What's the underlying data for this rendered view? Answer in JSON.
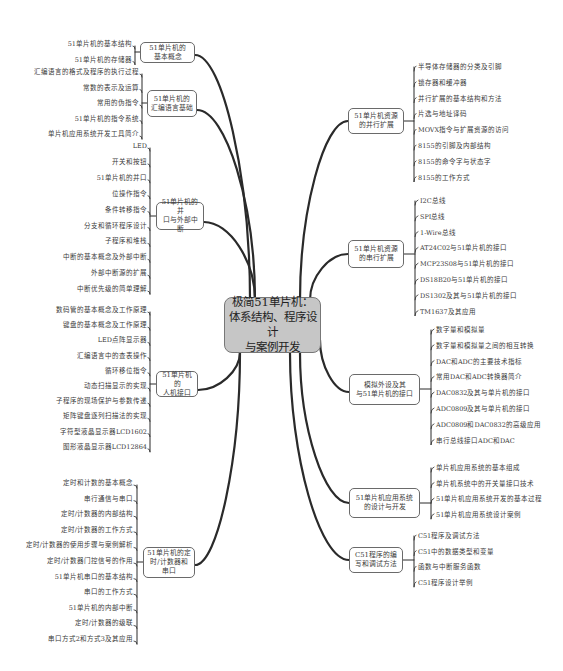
{
  "center": {
    "label": "极简51单片机：\n体系结构、程序设计\n与案例开发"
  },
  "left_branches": [
    {
      "label": "51单片机的\n基本概念",
      "children": [
        "51单片机的基本结构",
        "51单片机的存储器"
      ]
    },
    {
      "label": "51单片机的\n汇编语言基础",
      "children": [
        "汇编语言的格式及程序的执行过程",
        "常数的表示及运算",
        "常用的伪指令",
        "51单片机的指令系统",
        "单片机应用系统开发工具简介"
      ]
    },
    {
      "label": "51单片机的并\n口与外部中断",
      "children": [
        "LED",
        "开关和按钮",
        "51单片机的并口",
        "位操作指令",
        "条件转移指令",
        "分支和循环程序设计",
        "子程序和堆栈",
        "中断的基本概念及外部中断",
        "外部中断源的扩展",
        "中断优先级的简单理解"
      ]
    },
    {
      "label": "51单片机的\n人机接口",
      "children": [
        "数码管的基本概念及工作原理",
        "键盘的基本概念及工作原理",
        "LED点阵显示器",
        "汇编语言中的查表操作",
        "循环移位指令",
        "动态扫描显示的实现",
        "子程序的现场保护与参数传递",
        "矩阵键盘逐列扫描法的实现",
        "字符型液晶显示器LCD1602",
        "图形液晶显示器LCD12864"
      ]
    },
    {
      "label": "51单片机的定\n时/计数器和串口",
      "children": [
        "定时和计数的基本概念",
        "串行通信与串口",
        "定时/计数器的内部结构",
        "定时/计数器的工作方式",
        "定时/计数器的使用步骤与案例解析",
        "定时/计数器门控信号的作用",
        "51单片机串口的基本结构",
        "串口的工作方式",
        "51单片机的内部中断",
        "定时/计数器的级联",
        "串口方式2和方式3及其应用"
      ]
    }
  ],
  "right_branches": [
    {
      "label": "51单片机资源\n的并行扩展",
      "children": [
        "半导体存储器的分类及引脚",
        "锁存器和缓冲器",
        "并行扩展的基本结构和方法",
        "片选与地址译码",
        "MOVX指令与扩展资源的访问",
        "8155的引脚及内部结构",
        "8155的命令字与状态字",
        "8155的工作方式"
      ]
    },
    {
      "label": "51单片机资源\n的串行扩展",
      "children": [
        "I2C总线",
        "SPI总线",
        "1-Wire总线",
        "AT24C02与51单片机的接口",
        "MCP23S08与51单片机的接口",
        "DS18B20与51单片机的接口",
        "DS1302及其与51单片机的接口",
        "TM1637及其应用"
      ]
    },
    {
      "label": "模拟外设及其\n与51单片机的接口",
      "children": [
        "数字量和模拟量",
        "数字量和模拟量之间的相互转换",
        "DAC和ADC的主要技术指标",
        "常用DAC和ADC转换器简介",
        "DAC0832及其与单片机的接口",
        "ADC0809及其与单片机的接口",
        "ADC0809和DAC0832的高级应用",
        "串行总线接口ADC和DAC"
      ]
    },
    {
      "label": "51单片机应用系统\n的设计与开发",
      "children": [
        "单片机应用系统的基本组成",
        "单片机系统中的开关量接口技术",
        "51单片机应用系统开发的基本过程",
        "51单片机应用系统设计案例"
      ]
    },
    {
      "label": "C51程序的编\n写和调试方法",
      "children": [
        "C51程序及调试方法",
        "C51中的数据类型和变量",
        "函数与中断服务函数",
        "C51程序设计举例"
      ]
    }
  ],
  "colors": {
    "line": "#2a2a2a",
    "center_fill": "#c6c6c6",
    "node_border": "#6a6a6a",
    "text": "#3a3a3a"
  }
}
